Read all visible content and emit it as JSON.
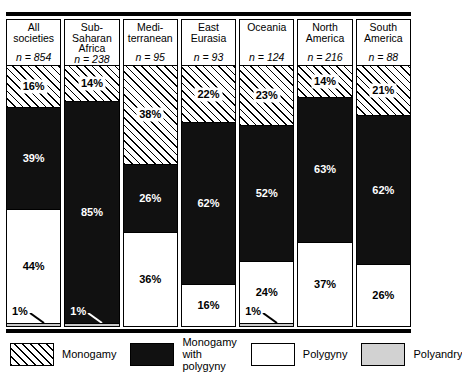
{
  "chart_data": {
    "type": "bar",
    "subtype": "stacked-percentage",
    "title": "",
    "xlabel": "",
    "ylabel": "",
    "ylim": [
      0,
      100
    ],
    "grid": false,
    "legend_position": "bottom",
    "stack_order_top_to_bottom": [
      "Monogamy",
      "Monogamy with polygyny",
      "Polygyny",
      "Polyandry"
    ],
    "categories": [
      "All societies",
      "Sub-Saharan Africa",
      "Mediterranean",
      "East Eurasia",
      "Oceania",
      "North America",
      "South America"
    ],
    "sample_sizes": [
      854,
      238,
      95,
      93,
      124,
      216,
      88
    ],
    "series": [
      {
        "name": "Monogamy",
        "values": [
          16,
          14,
          38,
          22,
          23,
          14,
          21
        ]
      },
      {
        "name": "Monogamy with polygyny",
        "values": [
          39,
          85,
          26,
          62,
          52,
          63,
          62
        ]
      },
      {
        "name": "Polygyny",
        "values": [
          44,
          1,
          36,
          16,
          24,
          37,
          26
        ]
      },
      {
        "name": "Polyandry",
        "values": [
          1,
          1,
          0,
          0,
          1,
          0,
          0
        ]
      }
    ]
  },
  "columns": [
    {
      "title": "All\nsocieties",
      "n_label": "n = 854",
      "segments": [
        {
          "key": "monogamy",
          "label": "16%",
          "value": 16
        },
        {
          "key": "mono-poly",
          "label": "39%",
          "value": 39
        },
        {
          "key": "polygyny",
          "label": "44%",
          "value": 44
        },
        {
          "key": "polyandry",
          "label": "",
          "value": 1
        }
      ],
      "callout": {
        "label": "1%",
        "on": "light"
      }
    },
    {
      "title": "Sub-\nSaharan\nAfrica",
      "n_label": "n = 238",
      "segments": [
        {
          "key": "monogamy",
          "label": "14%",
          "value": 14
        },
        {
          "key": "mono-poly",
          "label": "85%",
          "value": 85
        },
        {
          "key": "polyandry",
          "label": "",
          "value": 1
        }
      ],
      "callout": {
        "label": "1%",
        "on": "dark"
      }
    },
    {
      "title": "Medi-\nterranean",
      "n_label": "n = 95",
      "segments": [
        {
          "key": "monogamy",
          "label": "38%",
          "value": 38
        },
        {
          "key": "mono-poly",
          "label": "26%",
          "value": 26
        },
        {
          "key": "polygyny",
          "label": "36%",
          "value": 36
        }
      ],
      "callout": null
    },
    {
      "title": "East\nEurasia",
      "n_label": "n = 93",
      "segments": [
        {
          "key": "monogamy",
          "label": "22%",
          "value": 22
        },
        {
          "key": "mono-poly",
          "label": "62%",
          "value": 62
        },
        {
          "key": "polygyny",
          "label": "16%",
          "value": 16
        }
      ],
      "callout": null
    },
    {
      "title": "Oceania",
      "n_label": "n = 124",
      "segments": [
        {
          "key": "monogamy",
          "label": "23%",
          "value": 23
        },
        {
          "key": "mono-poly",
          "label": "52%",
          "value": 52
        },
        {
          "key": "polygyny",
          "label": "24%",
          "value": 24
        },
        {
          "key": "polyandry",
          "label": "",
          "value": 1
        }
      ],
      "callout": {
        "label": "1%",
        "on": "light"
      }
    },
    {
      "title": "North\nAmerica",
      "n_label": "n = 216",
      "segments": [
        {
          "key": "monogamy",
          "label": "14%",
          "value": 14
        },
        {
          "key": "mono-poly",
          "label": "63%",
          "value": 63
        },
        {
          "key": "polygyny",
          "label": "37%",
          "value": 37
        }
      ],
      "callout": null
    },
    {
      "title": "South\nAmerica",
      "n_label": "n = 88",
      "segments": [
        {
          "key": "monogamy",
          "label": "21%",
          "value": 21
        },
        {
          "key": "mono-poly",
          "label": "62%",
          "value": 62
        },
        {
          "key": "polygyny",
          "label": "26%",
          "value": 26
        }
      ],
      "callout": null
    }
  ],
  "legend": [
    {
      "key": "monogamy",
      "label": "Monogamy"
    },
    {
      "key": "mono-poly",
      "label": "Monogamy\nwith polygyny"
    },
    {
      "key": "polygyny",
      "label": "Polygyny"
    },
    {
      "key": "polyandry",
      "label": "Polyandry"
    }
  ],
  "colors": {
    "monogamy_fill": "#ffffff",
    "monogamy_hatch": "#000000",
    "mono_poly": "#111111",
    "polygyny": "#ffffff",
    "polyandry": "#c9c9c9",
    "rule": "#000000"
  }
}
